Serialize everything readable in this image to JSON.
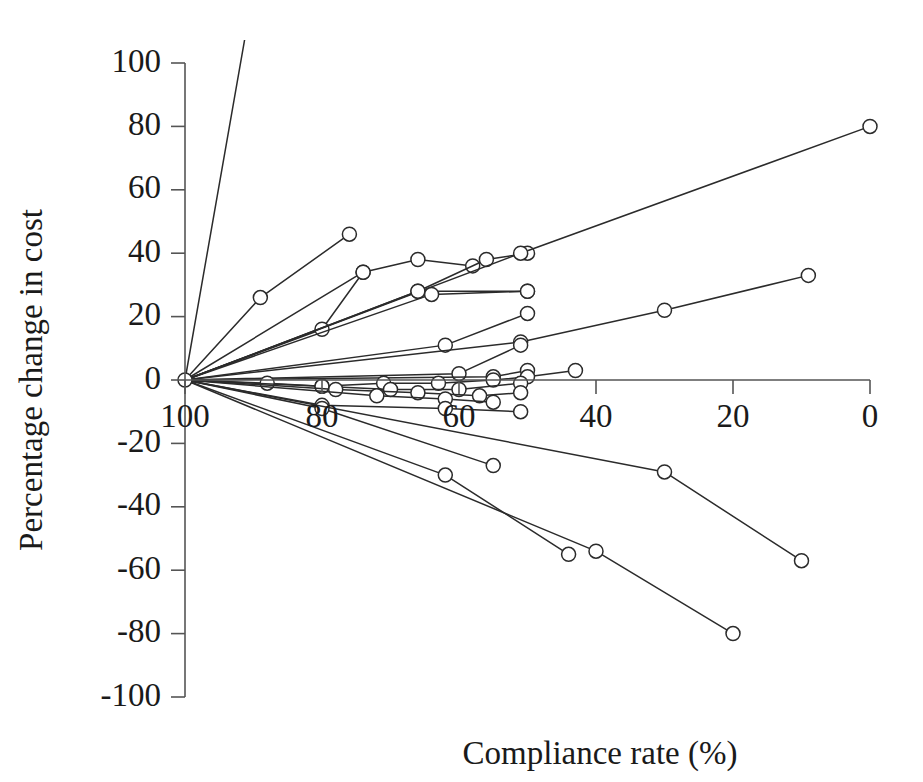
{
  "chart_data": {
    "type": "line",
    "title": "",
    "subtitle": "",
    "xlabel": "Compliance rate (%)",
    "ylabel": "Percentage change in cost",
    "xlim": [
      100,
      0
    ],
    "ylim": [
      -100,
      100
    ],
    "x_reversed": true,
    "grid": false,
    "legend": null,
    "legend_position": "none",
    "x_ticks": [
      100,
      80,
      60,
      40,
      20,
      0
    ],
    "x_tick_labels": [
      "100",
      "80",
      "60",
      "40",
      "20",
      "0"
    ],
    "y_ticks": [
      -100,
      -80,
      -60,
      -40,
      -20,
      0,
      20,
      40,
      60,
      80,
      100
    ],
    "y_tick_labels": [
      "-100",
      "-80",
      "-60",
      "-40",
      "-20",
      "0",
      "20",
      "40",
      "60",
      "80",
      "100"
    ],
    "marker": "open-circle",
    "marker_face_color": "#ffffff",
    "marker_edge_color": "#2b2b2b",
    "line_color": "#2b2b2b",
    "axis_color": "#555555",
    "note": "All series originate at (100, 0); x axis runs right-to-left from 100 to 0",
    "series": [
      {
        "name": "S01",
        "x": [
          100,
          88
        ],
        "y": [
          0,
          148
        ]
      },
      {
        "name": "S02",
        "x": [
          100,
          89,
          76
        ],
        "y": [
          0,
          26,
          46
        ]
      },
      {
        "name": "S03",
        "x": [
          100,
          80,
          74
        ],
        "y": [
          0,
          16,
          34
        ]
      },
      {
        "name": "S04",
        "x": [
          100,
          74,
          66,
          58
        ],
        "y": [
          0,
          34,
          38,
          36
        ]
      },
      {
        "name": "S05",
        "x": [
          100,
          66,
          56,
          50
        ],
        "y": [
          0,
          28,
          38,
          40
        ]
      },
      {
        "name": "S06",
        "x": [
          100,
          51,
          0
        ],
        "y": [
          0,
          40,
          80
        ]
      },
      {
        "name": "S07",
        "x": [
          100,
          66,
          50
        ],
        "y": [
          0,
          28,
          28
        ]
      },
      {
        "name": "S08",
        "x": [
          100,
          64,
          50
        ],
        "y": [
          0,
          27,
          28
        ]
      },
      {
        "name": "S09",
        "x": [
          100,
          62,
          50
        ],
        "y": [
          0,
          11,
          21
        ]
      },
      {
        "name": "S10",
        "x": [
          100,
          51,
          30,
          9
        ],
        "y": [
          0,
          12,
          22,
          33
        ]
      },
      {
        "name": "S11",
        "x": [
          100,
          60,
          51
        ],
        "y": [
          0,
          2,
          11
        ]
      },
      {
        "name": "S12",
        "x": [
          100,
          55,
          50
        ],
        "y": [
          0,
          1,
          3
        ]
      },
      {
        "name": "S13",
        "x": [
          100,
          88,
          80,
          71,
          63,
          55,
          50,
          43
        ],
        "y": [
          0,
          -1,
          -2,
          -1,
          -1,
          0,
          1,
          3
        ]
      },
      {
        "name": "S14",
        "x": [
          100,
          80,
          70,
          60,
          51
        ],
        "y": [
          0,
          -2,
          -3,
          -3,
          -1
        ]
      },
      {
        "name": "S15",
        "x": [
          100,
          78,
          66,
          57,
          51
        ],
        "y": [
          0,
          -3,
          -4,
          -5,
          -4
        ]
      },
      {
        "name": "S16",
        "x": [
          100,
          72,
          62,
          55
        ],
        "y": [
          0,
          -5,
          -6,
          -7
        ]
      },
      {
        "name": "S17",
        "x": [
          100,
          80,
          62,
          51
        ],
        "y": [
          0,
          -8,
          -9,
          -10
        ]
      },
      {
        "name": "S18",
        "x": [
          100,
          80,
          55
        ],
        "y": [
          0,
          -9,
          -27
        ]
      },
      {
        "name": "S19",
        "x": [
          100,
          62,
          44
        ],
        "y": [
          0,
          -30,
          -55
        ]
      },
      {
        "name": "S20",
        "x": [
          100,
          30,
          10
        ],
        "y": [
          0,
          -29,
          -57
        ]
      },
      {
        "name": "S21",
        "x": [
          100,
          40,
          20
        ],
        "y": [
          0,
          -54,
          -80
        ]
      }
    ]
  }
}
